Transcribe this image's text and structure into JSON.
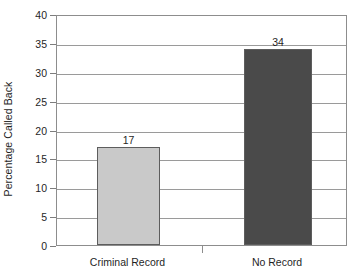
{
  "chart_data": {
    "type": "bar",
    "title": "",
    "subtitle": "",
    "xlabel": "",
    "ylabel": "Percentage Called Back",
    "categories": [
      "Criminal Record",
      "No Record"
    ],
    "values": [
      17,
      34
    ],
    "value_labels": [
      "17",
      "34"
    ],
    "ylim": [
      0,
      40
    ],
    "ytick_step": 5,
    "ytick_labels": [
      "0",
      "5",
      "10",
      "15",
      "20",
      "25",
      "30",
      "35",
      "40"
    ],
    "ytick_values": [
      0,
      5,
      10,
      15,
      20,
      25,
      30,
      35,
      40
    ],
    "grid": {
      "horizontal": true,
      "vertical": false
    },
    "legend": {
      "visible": false,
      "position": "none"
    },
    "series": [
      {
        "name": "Percentage Called Back",
        "values": [
          17,
          34
        ],
        "colors": [
          "#c9c9c9",
          "#4a4a4a"
        ]
      }
    ],
    "bar_colors": [
      "#c9c9c9",
      "#4a4a4a"
    ],
    "bar_border_color": "#5d5d5d",
    "background_color": "#ffffff",
    "axis_color": "#8d8d8d",
    "gridline_color": "#9a9a9a",
    "text_color": "#1f1f1f"
  }
}
